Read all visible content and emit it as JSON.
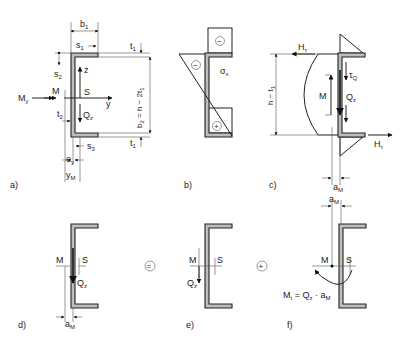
{
  "panels": {
    "a": {
      "caption": "a)",
      "labels": {
        "b1": "b",
        "b1_sub": "1",
        "s1": "s",
        "s1_sub": "1",
        "t1_top": "t",
        "t1_top_sub": "1",
        "t1_bot": "t",
        "t1_bot_sub": "1",
        "s2": "s",
        "s2_sub": "2",
        "z": "z",
        "S": "S",
        "y": "y",
        "My": "M",
        "My_sub": "y",
        "M": "M",
        "t2": "t",
        "t2_sub": "2",
        "Qz": "Q",
        "Qz_sub": "z",
        "s3": "s",
        "s3_sub": "3",
        "ey": "e",
        "ey_sub": "y",
        "yM": "y",
        "yM_sub": "M",
        "b2": "b",
        "b2_sub": "2",
        "b2_rest": " = h − 2t",
        "b2_rest_sub": "1"
      }
    },
    "b": {
      "caption": "b)",
      "labels": {
        "sigma": "σ",
        "sigma_sub": "x",
        "minus": "−",
        "plus": "+"
      }
    },
    "c": {
      "caption": "c)",
      "labels": {
        "Ht_top": "H",
        "Ht_top_sub": "τ",
        "Ht_bot": "H",
        "Ht_bot_sub": "τ",
        "tauQ": "τ",
        "tauQ_sub": "Q",
        "M": "M",
        "Qz": "Q",
        "Qz_sub": "z",
        "h_t1": "h − t",
        "h_t1_sub": "1",
        "aM": "a",
        "aM_sub": "M"
      }
    },
    "d": {
      "caption": "d)",
      "labels": {
        "M": "M",
        "S": "S",
        "Qz": "Q",
        "Qz_sub": "z",
        "aM": "a",
        "aM_sub": "M"
      }
    },
    "equals": "=",
    "e": {
      "caption": "e)",
      "labels": {
        "M": "M",
        "S": "S",
        "Qz": "Q",
        "Qz_sub": "z"
      }
    },
    "plus": "+",
    "f": {
      "caption": "f)",
      "labels": {
        "aM": "a",
        "aM_sub": "M",
        "M": "M",
        "S": "S",
        "Mt_formula": "M",
        "Mt_sub": "t",
        "Mt_rest": " = Q",
        "Mt_rest_sub": "z",
        "Mt_tail": " · a",
        "Mt_tail_sub": "M"
      }
    }
  }
}
